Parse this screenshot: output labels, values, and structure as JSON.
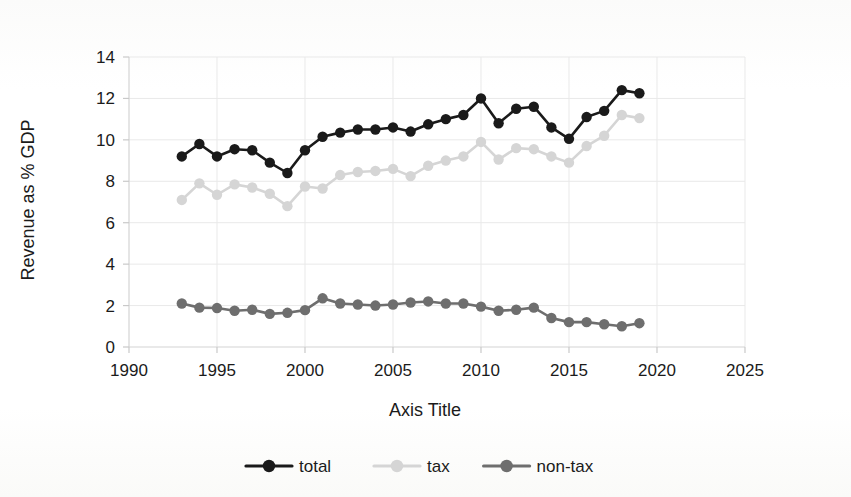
{
  "chart_data": {
    "type": "line",
    "title": "",
    "xlabel": "Axis Title",
    "ylabel": "Revenue as % GDP",
    "xlim": [
      1990,
      2025
    ],
    "ylim": [
      0,
      14
    ],
    "xticks": [
      1990,
      1995,
      2000,
      2005,
      2010,
      2015,
      2020,
      2025
    ],
    "yticks": [
      0,
      2,
      4,
      6,
      8,
      10,
      12,
      14
    ],
    "grid": true,
    "legend_position": "bottom",
    "x": [
      1993,
      1994,
      1995,
      1996,
      1997,
      1998,
      1999,
      2000,
      2001,
      2002,
      2003,
      2004,
      2005,
      2006,
      2007,
      2008,
      2009,
      2010,
      2011,
      2012,
      2013,
      2014,
      2015,
      2016,
      2017,
      2018,
      2019
    ],
    "series": [
      {
        "name": "total",
        "color": "#1a1a1a",
        "values": [
          9.2,
          9.8,
          9.2,
          9.55,
          9.5,
          8.9,
          8.4,
          9.5,
          10.15,
          10.35,
          10.5,
          10.5,
          10.6,
          10.4,
          10.75,
          11.0,
          11.2,
          12.0,
          10.8,
          11.5,
          11.6,
          10.6,
          10.05,
          11.1,
          11.4,
          12.4,
          12.25
        ]
      },
      {
        "name": "tax",
        "color": "#d5d5d5",
        "values": [
          7.1,
          7.9,
          7.35,
          7.85,
          7.7,
          7.4,
          6.8,
          7.75,
          7.65,
          8.3,
          8.45,
          8.5,
          8.6,
          8.25,
          8.75,
          9.0,
          9.2,
          9.9,
          9.05,
          9.6,
          9.55,
          9.2,
          8.9,
          9.7,
          10.2,
          11.2,
          11.05
        ]
      },
      {
        "name": "non-tax",
        "color": "#6e6e6e",
        "values": [
          2.1,
          1.9,
          1.88,
          1.75,
          1.8,
          1.6,
          1.65,
          1.78,
          2.35,
          2.1,
          2.05,
          2.0,
          2.05,
          2.15,
          2.2,
          2.1,
          2.1,
          1.95,
          1.75,
          1.8,
          1.9,
          1.4,
          1.2,
          1.2,
          1.1,
          1.0,
          1.15
        ]
      }
    ],
    "legend": [
      {
        "label": "total",
        "color": "#1a1a1a"
      },
      {
        "label": "tax",
        "color": "#d5d5d5"
      },
      {
        "label": "non-tax",
        "color": "#6e6e6e"
      }
    ]
  }
}
